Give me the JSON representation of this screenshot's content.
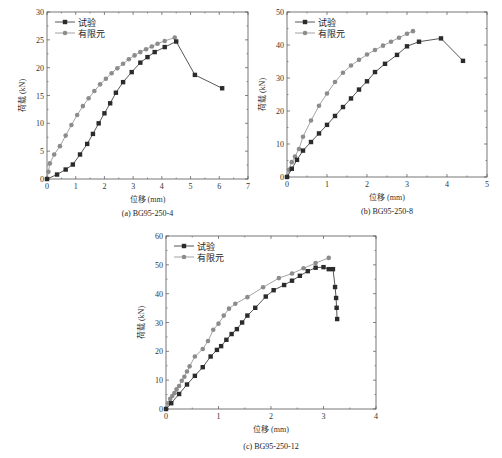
{
  "colors": {
    "test": "#2b2b2b",
    "fem": "#8c8c8c",
    "axis": "#555555"
  },
  "chart_data": [
    {
      "type": "line",
      "title": "(a) BG95-250-4",
      "xlabel": "位移 (mm)",
      "ylabel": "荷载 (kN)",
      "xlim": [
        0,
        7
      ],
      "ylim": [
        0,
        30
      ],
      "xticks": [
        0,
        1,
        2,
        3,
        4,
        5,
        6,
        7
      ],
      "yticks": [
        0,
        5,
        10,
        15,
        20,
        25,
        30
      ],
      "legend": [
        "试验",
        "有限元"
      ],
      "legend_position": "upper left",
      "series": [
        {
          "name": "试验",
          "marker": "square",
          "x": [
            0,
            0.35,
            0.65,
            0.9,
            1.15,
            1.4,
            1.6,
            1.8,
            2.0,
            2.2,
            2.4,
            2.65,
            2.95,
            3.25,
            3.5,
            3.75,
            4.1,
            4.5,
            5.15,
            6.1
          ],
          "y": [
            0,
            0.8,
            1.7,
            2.6,
            4.4,
            6.3,
            8.1,
            10.0,
            11.8,
            13.6,
            15.5,
            17.4,
            19.2,
            20.9,
            21.9,
            22.8,
            23.7,
            24.7,
            18.7,
            16.3
          ]
        },
        {
          "name": "有限元",
          "marker": "circle",
          "x": [
            0,
            0.05,
            0.1,
            0.25,
            0.45,
            0.65,
            0.85,
            1.05,
            1.25,
            1.45,
            1.65,
            1.85,
            2.05,
            2.25,
            2.45,
            2.65,
            2.85,
            3.05,
            3.25,
            3.45,
            3.65,
            3.85,
            4.1,
            4.45
          ],
          "y": [
            0,
            1.3,
            2.8,
            4.4,
            5.9,
            7.8,
            9.7,
            11.5,
            13.1,
            14.5,
            15.8,
            17.0,
            18.0,
            19.0,
            19.9,
            20.7,
            21.5,
            22.2,
            22.8,
            23.3,
            23.8,
            24.3,
            24.8,
            25.4
          ]
        }
      ]
    },
    {
      "type": "line",
      "title": "(b) BG95-250-8",
      "xlabel": "位移 (mm)",
      "ylabel": "荷载 (kN)",
      "xlim": [
        0,
        5
      ],
      "ylim": [
        0,
        50
      ],
      "xticks": [
        0,
        1,
        2,
        3,
        4,
        5
      ],
      "yticks": [
        0,
        10,
        20,
        30,
        40,
        50
      ],
      "legend": [
        "试验",
        "有限元"
      ],
      "legend_position": "upper left",
      "series": [
        {
          "name": "试验",
          "marker": "square",
          "x": [
            0,
            0.12,
            0.25,
            0.4,
            0.6,
            0.8,
            1.0,
            1.2,
            1.4,
            1.6,
            1.8,
            2.0,
            2.2,
            2.45,
            2.75,
            3.0,
            3.3,
            3.85,
            4.4
          ],
          "y": [
            0,
            2.5,
            5.2,
            8.0,
            10.6,
            13.2,
            15.8,
            18.5,
            21.2,
            23.8,
            26.5,
            29.0,
            31.8,
            34.3,
            37.0,
            39.6,
            41.0,
            42.0,
            35.2
          ]
        },
        {
          "name": "有限元",
          "marker": "circle",
          "x": [
            0,
            0.05,
            0.12,
            0.2,
            0.3,
            0.4,
            0.6,
            0.8,
            1.0,
            1.2,
            1.4,
            1.6,
            1.8,
            2.0,
            2.2,
            2.4,
            2.6,
            2.8,
            3.0,
            3.15
          ],
          "y": [
            0,
            2.2,
            4.5,
            6.2,
            8.5,
            12.2,
            17.1,
            21.6,
            25.3,
            28.8,
            31.6,
            33.8,
            35.5,
            37.1,
            38.5,
            39.8,
            41.0,
            42.2,
            43.4,
            44.2
          ]
        }
      ]
    },
    {
      "type": "line",
      "title": "(c) BG95-250-12",
      "xlabel": "位移 (mm)",
      "ylabel": "荷载 (kN)",
      "xlim": [
        0,
        4
      ],
      "ylim": [
        0,
        60
      ],
      "xticks": [
        0,
        1,
        2,
        3,
        4
      ],
      "yticks": [
        0,
        10,
        20,
        30,
        40,
        50,
        60
      ],
      "legend": [
        "试验",
        "有限元"
      ],
      "legend_position": "upper left",
      "series": [
        {
          "name": "试验",
          "marker": "square",
          "x": [
            0,
            0.1,
            0.25,
            0.4,
            0.55,
            0.7,
            0.85,
            0.97,
            1.05,
            1.15,
            1.25,
            1.35,
            1.45,
            1.55,
            1.7,
            1.9,
            2.05,
            2.25,
            2.4,
            2.55,
            2.7,
            2.85,
            3.0,
            3.1,
            3.18,
            3.22,
            3.24,
            3.25,
            3.26
          ],
          "y": [
            0,
            2.0,
            5.2,
            8.5,
            11.5,
            14.5,
            18.2,
            20.5,
            21.8,
            24.0,
            26.0,
            27.7,
            30.0,
            32.4,
            35.1,
            39.0,
            41.2,
            43.0,
            44.5,
            46.2,
            47.8,
            49.0,
            49.2,
            48.5,
            48.5,
            42.3,
            38.5,
            35.1,
            31.2
          ]
        },
        {
          "name": "有限元",
          "marker": "circle",
          "x": [
            0,
            0.04,
            0.08,
            0.12,
            0.16,
            0.2,
            0.25,
            0.3,
            0.35,
            0.4,
            0.45,
            0.55,
            0.7,
            0.8,
            0.9,
            1.0,
            1.1,
            1.2,
            1.32,
            1.55,
            1.85,
            2.15,
            2.4,
            2.62,
            2.85,
            3.1
          ],
          "y": [
            0,
            2.0,
            3.5,
            4.5,
            5.5,
            6.8,
            8.0,
            9.8,
            11.2,
            13.0,
            14.8,
            18.2,
            20.8,
            23.6,
            27.5,
            29.6,
            32.4,
            34.8,
            36.5,
            38.8,
            42.2,
            45.4,
            47.0,
            48.8,
            50.6,
            52.4
          ]
        }
      ]
    }
  ],
  "captions": {
    "a": "(a) BG95-250-4",
    "b": "(b) BG95-250-8",
    "c": "(c) BG95-250-12"
  },
  "axis_labels": {
    "x": "位移 (mm)",
    "y": "荷载 (kN)"
  },
  "legend": {
    "test": "试验",
    "fem": "有限元"
  }
}
